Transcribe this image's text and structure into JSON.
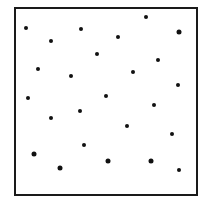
{
  "figure": {
    "frame": {
      "left": 14,
      "top": 7,
      "right": 196,
      "bottom": 194,
      "stroke": "#1a1a1a"
    },
    "dot_color": "#111111",
    "dots": [
      {
        "x": 26,
        "y": 28,
        "r": 2
      },
      {
        "x": 81,
        "y": 29,
        "r": 2
      },
      {
        "x": 146,
        "y": 17,
        "r": 2
      },
      {
        "x": 179,
        "y": 32,
        "r": 2.5
      },
      {
        "x": 51,
        "y": 41,
        "r": 2
      },
      {
        "x": 118,
        "y": 37,
        "r": 2
      },
      {
        "x": 97,
        "y": 54,
        "r": 2
      },
      {
        "x": 158,
        "y": 60,
        "r": 2
      },
      {
        "x": 38,
        "y": 69,
        "r": 2
      },
      {
        "x": 71,
        "y": 76,
        "r": 2
      },
      {
        "x": 133,
        "y": 72,
        "r": 2
      },
      {
        "x": 178,
        "y": 85,
        "r": 2
      },
      {
        "x": 28,
        "y": 98,
        "r": 2
      },
      {
        "x": 106,
        "y": 96,
        "r": 2
      },
      {
        "x": 154,
        "y": 105,
        "r": 2
      },
      {
        "x": 80,
        "y": 111,
        "r": 2
      },
      {
        "x": 51,
        "y": 118,
        "r": 2
      },
      {
        "x": 127,
        "y": 126,
        "r": 2
      },
      {
        "x": 172,
        "y": 134,
        "r": 2
      },
      {
        "x": 84,
        "y": 145,
        "r": 2
      },
      {
        "x": 34,
        "y": 154,
        "r": 2.5
      },
      {
        "x": 60,
        "y": 168,
        "r": 2.5
      },
      {
        "x": 108,
        "y": 161,
        "r": 2.5
      },
      {
        "x": 151,
        "y": 161,
        "r": 2.5
      },
      {
        "x": 179,
        "y": 170,
        "r": 2
      }
    ]
  }
}
